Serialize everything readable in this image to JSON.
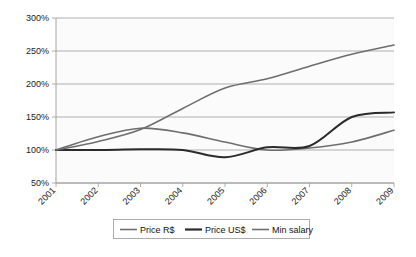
{
  "chart_data": {
    "type": "line",
    "title": "",
    "subtitle": "",
    "xlabel": "",
    "ylabel": "",
    "categories": [
      "2001",
      "2002",
      "2003",
      "2004",
      "2005",
      "2006",
      "2007",
      "2008",
      "2009"
    ],
    "x": [
      2001,
      2002,
      2003,
      2004,
      2005,
      2006,
      2007,
      2008,
      2009
    ],
    "ylim": [
      50,
      300
    ],
    "ytick_labels": [
      "50%",
      "100%",
      "150%",
      "200%",
      "250%",
      "300%"
    ],
    "ytick_values": [
      50,
      100,
      150,
      200,
      250,
      300
    ],
    "grid": true,
    "legend_position": "bottom",
    "series": [
      {
        "name": "Price R$",
        "color": "#6e6e6e",
        "width": 1.6,
        "values": [
          100,
          120,
          133,
          126,
          112,
          100,
          103,
          112,
          130
        ]
      },
      {
        "name": "Price US$",
        "color": "#2b2b2b",
        "width": 2.0,
        "values": [
          100,
          100,
          101,
          100,
          89,
          104,
          106,
          150,
          157
        ]
      },
      {
        "name": "Min salary",
        "color": "#6e6e6e",
        "width": 1.6,
        "values": [
          100,
          113,
          131,
          163,
          194,
          208,
          227,
          245,
          259
        ]
      }
    ]
  },
  "axis": {
    "y_ticks": [
      {
        "label": "300%",
        "value": 300
      },
      {
        "label": "250%",
        "value": 250
      },
      {
        "label": "200%",
        "value": 200
      },
      {
        "label": "150%",
        "value": 150
      },
      {
        "label": "100%",
        "value": 100
      },
      {
        "label": "50%",
        "value": 50
      }
    ],
    "x_ticks": [
      {
        "label": "2001"
      },
      {
        "label": "2002"
      },
      {
        "label": "2003"
      },
      {
        "label": "2004"
      },
      {
        "label": "2005"
      },
      {
        "label": "2006"
      },
      {
        "label": "2007"
      },
      {
        "label": "2008"
      },
      {
        "label": "2009"
      }
    ]
  },
  "legend": {
    "items": [
      {
        "label": "Price R$",
        "color": "#6e6e6e",
        "width": 1.6
      },
      {
        "label": "Price US$",
        "color": "#2b2b2b",
        "width": 2.2
      },
      {
        "label": "Min salary",
        "color": "#6e6e6e",
        "width": 1.6
      }
    ]
  },
  "colors": {
    "grid": "#8f8f8f",
    "axis": "#9a9a9a",
    "plot_background": "#fbfbfb",
    "page_background": "#ffffff",
    "text": "#222222"
  }
}
